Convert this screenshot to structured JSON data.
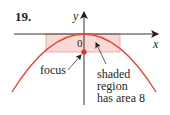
{
  "problem": {
    "number": "19."
  },
  "axes": {
    "x_label": "x",
    "y_label": "y",
    "origin_label": "0"
  },
  "annotations": {
    "focus_label": "focus",
    "region_label_lines": [
      "shaded",
      "region",
      "has area 8"
    ]
  },
  "colors": {
    "curve": "#e0453c",
    "shade_fill": "#f9d9d6",
    "shade_stroke": "#e8a09a",
    "focus_dot": "#e0302a",
    "axis": "#231f20",
    "text": "#231f20"
  }
}
